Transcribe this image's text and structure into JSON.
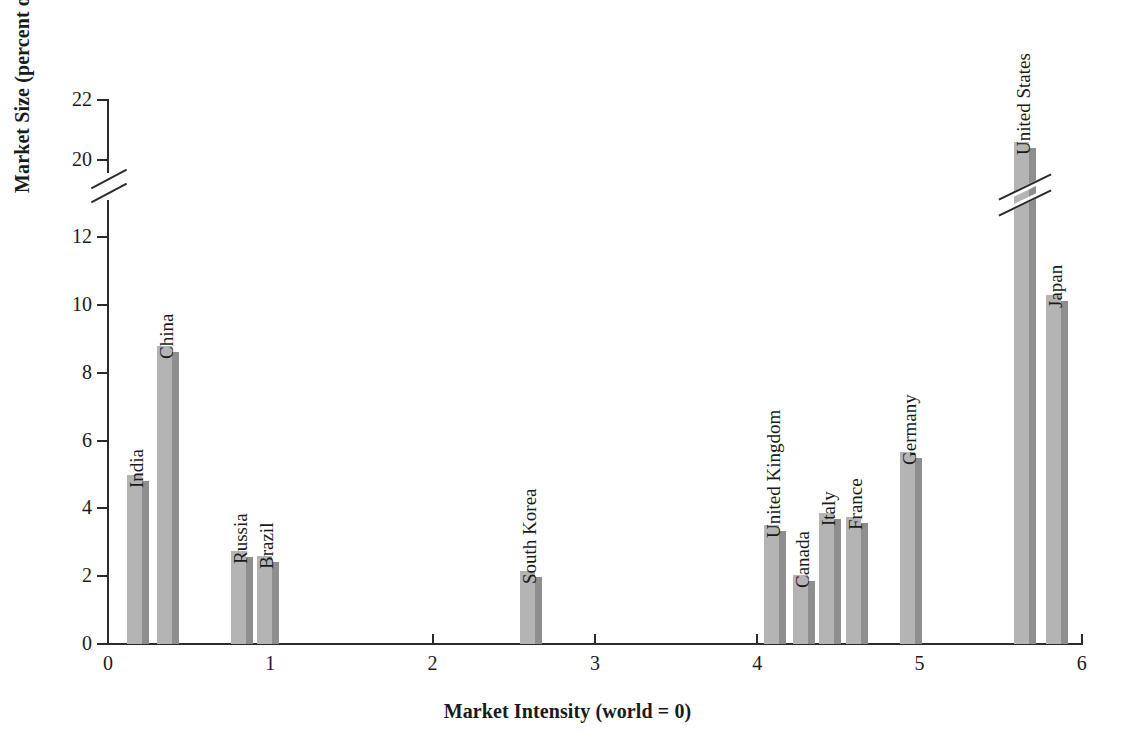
{
  "chart_data": {
    "type": "bar",
    "title": "",
    "xlabel": "Market Intensity (world = 0)",
    "ylabel": "Market Size (percent of world market)",
    "xlim": [
      0,
      6
    ],
    "ylim": [
      0,
      22
    ],
    "grid": false,
    "legend": "none",
    "y_axis_break": {
      "from": 12,
      "to": 20
    },
    "xticks": [
      "0",
      "1",
      "2",
      "3",
      "4",
      "5",
      "6"
    ],
    "yticks": [
      "0",
      "2",
      "4",
      "6",
      "8",
      "10",
      "12",
      "20",
      "22"
    ],
    "bar_face_color": "#b4b4b4",
    "bar_side_color": "#8e8e8e",
    "axis_color": "#2b2b2b",
    "categories": [
      "India",
      "China",
      "Russia",
      "Brazil",
      "South Korea",
      "United Kingdom",
      "Canada",
      "Italy",
      "France",
      "Germany",
      "United States",
      "Japan"
    ],
    "points": [
      {
        "label": "India",
        "x": 0.12,
        "y": 5.0
      },
      {
        "label": "China",
        "x": 0.3,
        "y": 8.8
      },
      {
        "label": "Russia",
        "x": 0.76,
        "y": 2.75
      },
      {
        "label": "Brazil",
        "x": 0.92,
        "y": 2.6
      },
      {
        "label": "South Korea",
        "x": 2.54,
        "y": 2.15
      },
      {
        "label": "United Kingdom",
        "x": 4.04,
        "y": 3.5
      },
      {
        "label": "Canada",
        "x": 4.22,
        "y": 2.05
      },
      {
        "label": "Italy",
        "x": 4.38,
        "y": 3.85
      },
      {
        "label": "France",
        "x": 4.55,
        "y": 3.75
      },
      {
        "label": "Germany",
        "x": 4.88,
        "y": 5.65
      },
      {
        "label": "United States",
        "x": 5.58,
        "y": 20.6
      },
      {
        "label": "Japan",
        "x": 5.78,
        "y": 10.3
      }
    ],
    "values": [
      5.0,
      8.8,
      2.75,
      2.6,
      2.15,
      3.5,
      2.05,
      3.85,
      3.75,
      5.65,
      20.6,
      10.3
    ]
  }
}
